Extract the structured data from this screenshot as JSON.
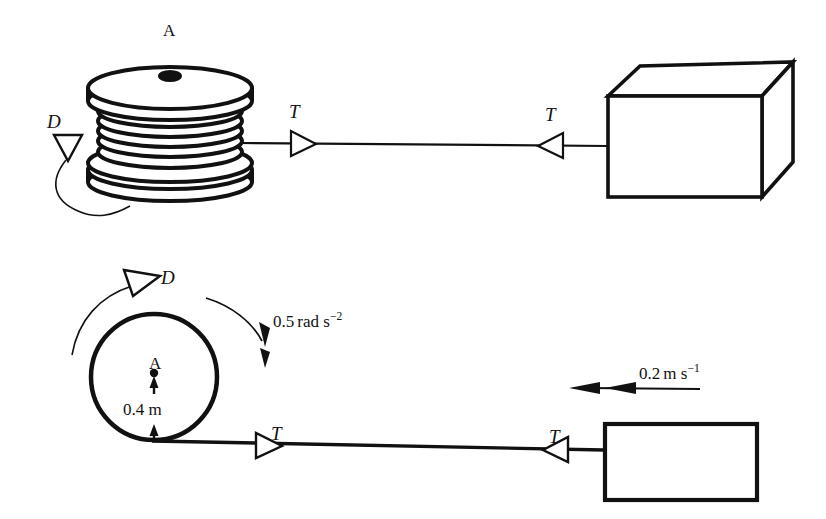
{
  "figure": {
    "stroke_color": "#111111",
    "background_color": "#ffffff"
  },
  "upper_view": {
    "name": "pictorial 3D view",
    "spool_label": "A",
    "drive_label": "D",
    "tension_label_left": "T",
    "tension_label_right": "T",
    "block_label": ""
  },
  "lower_view": {
    "name": "side schematic view",
    "drive_label": "D",
    "centre_label": "A",
    "radius_value": "0.4",
    "radius_unit": "m",
    "radius_label": "0.4 m",
    "angular_accel_value": "0.5",
    "angular_accel_unit_base": "rad s",
    "angular_accel_exponent": "−2",
    "angular_accel_label": "0.5 rad s−2",
    "velocity_value": "0.2",
    "velocity_unit_base": "m s",
    "velocity_exponent": "−1",
    "velocity_label": "0.2 m s−1",
    "tension_label_left": "T",
    "tension_label_right": "T"
  }
}
